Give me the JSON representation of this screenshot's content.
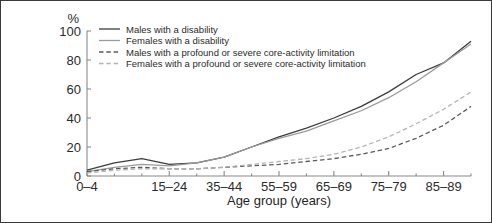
{
  "chart_data": {
    "type": "line",
    "title": "",
    "xlabel": "Age group (years)",
    "ylabel": "%",
    "ylim": [
      0,
      100
    ],
    "yticks": [
      0,
      20,
      40,
      60,
      80,
      100
    ],
    "grid": false,
    "legend_position": "top-left inside",
    "categories": [
      "0–4",
      "5–9",
      "10–14",
      "15–24",
      "25–34",
      "35–44",
      "45–54",
      "55–59",
      "60–64",
      "65–69",
      "70–74",
      "75–79",
      "80–84",
      "85–89",
      "90+"
    ],
    "xtick_labels": [
      "0–4",
      "15–24",
      "35–44",
      "55–59",
      "65–69",
      "75–79",
      "85–89"
    ],
    "xtick_label_indices": [
      0,
      3,
      5,
      7,
      9,
      11,
      13
    ],
    "series": [
      {
        "name": "Males with a disability",
        "style": "solid",
        "color": "#3c3c3c",
        "values": [
          4,
          9,
          12,
          8,
          9,
          13,
          20,
          27,
          33,
          40,
          48,
          58,
          70,
          78,
          93
        ]
      },
      {
        "name": "Females with a disability",
        "style": "solid",
        "color": "#9a9a9a",
        "values": [
          3,
          6,
          8,
          7,
          9,
          13,
          20,
          26,
          31,
          38,
          45,
          54,
          65,
          78,
          91
        ]
      },
      {
        "name": "Males with a profound or severe core-activity limitation",
        "style": "dashed",
        "color": "#5a5a5a",
        "values": [
          3,
          5,
          6,
          5,
          5,
          6,
          7,
          8,
          10,
          12,
          15,
          19,
          26,
          35,
          48
        ]
      },
      {
        "name": "Females with a profound or severe core-activity limitation",
        "style": "dashed",
        "color": "#b4b4b4",
        "values": [
          2,
          4,
          5,
          5,
          5,
          6,
          8,
          10,
          12,
          15,
          20,
          27,
          36,
          46,
          58
        ]
      }
    ]
  },
  "legend": {
    "entries": [
      {
        "label": "Males with a disability"
      },
      {
        "label": "Females with a disability"
      },
      {
        "label": "Males with a profound or severe core-activity limitation"
      },
      {
        "label": "Females with a profound or severe core-activity limitation"
      }
    ]
  },
  "colors": {
    "frame": "#3a3a3a",
    "axis": "#8a8a8a",
    "text": "#2b2b2b",
    "background": "#ffffff"
  }
}
